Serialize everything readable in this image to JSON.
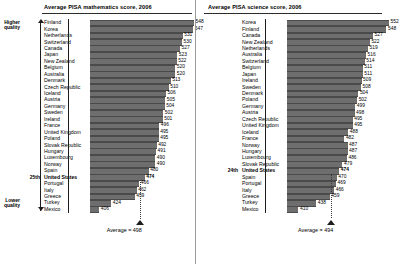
{
  "charts": [
    {
      "key": "math",
      "title": "Average PISA mathematics score, 2006",
      "higher_label_line1": "Higher",
      "higher_label_line2": "quality",
      "lower_label_line1": "Lower",
      "lower_label_line2": "quality",
      "us_rank": "25th",
      "average_label": "Average = 498",
      "average_value": 498,
      "bar_color": "#6e6e6e",
      "chart_data": {
        "type": "bar",
        "orientation": "horizontal",
        "title": "Average PISA mathematics score, 2006",
        "xlabel": "",
        "ylabel": "",
        "xlim": [
          400,
          560
        ],
        "grid": false,
        "legend": "none",
        "categories": [
          "Finland",
          "Korea",
          "Netherlands",
          "Switzerland",
          "Canada",
          "Japan",
          "New Zealand",
          "Belgium",
          "Australia",
          "Denmark",
          "Czech Republic",
          "Iceland",
          "Austria",
          "Germany",
          "Sweden",
          "Ireland",
          "France",
          "United Kingdom",
          "Poland",
          "Slovak Republic",
          "Hungary",
          "Luxembourg",
          "Norway",
          "Spain",
          "United States",
          "Portugal",
          "Italy",
          "Greece",
          "Turkey",
          "Mexico"
        ],
        "values": [
          548,
          547,
          531,
          530,
          527,
          523,
          522,
          520,
          520,
          513,
          510,
          506,
          505,
          504,
          502,
          501,
          496,
          495,
          495,
          492,
          491,
          490,
          490,
          480,
          474,
          466,
          462,
          459,
          424,
          406
        ],
        "highlight": "United States",
        "annotations": [
          "Average = 498"
        ]
      }
    },
    {
      "key": "science",
      "title": "Average PISA science score, 2006",
      "us_rank": "24th",
      "average_label": "Average = 494",
      "average_value": 494,
      "bar_color": "#6e6e6e",
      "chart_data": {
        "type": "bar",
        "orientation": "horizontal",
        "title": "Average PISA science score, 2006",
        "xlabel": "",
        "ylabel": "",
        "xlim": [
          400,
          560
        ],
        "grid": false,
        "legend": "none",
        "categories": [
          "Korea",
          "Finland",
          "Canada",
          "New Zealand",
          "Netherlands",
          "Australia",
          "Switzerland",
          "Belgium",
          "Japan",
          "Ireland",
          "Sweden",
          "Denmark",
          "Poland",
          "Germany",
          "Austria",
          "Czech Republic",
          "United Kingdom",
          "Iceland",
          "France",
          "Norway",
          "Hungary",
          "Luxembourg",
          "Slovak Republic",
          "United States",
          "Spain",
          "Portugal",
          "Italy",
          "Greece",
          "Turkey",
          "Mexico"
        ],
        "values": [
          552,
          548,
          527,
          522,
          519,
          516,
          514,
          511,
          511,
          509,
          508,
          504,
          502,
          499,
          498,
          495,
          495,
          488,
          482,
          487,
          487,
          486,
          479,
          474,
          470,
          469,
          466,
          459,
          438,
          410
        ],
        "highlight": "United States",
        "annotations": [
          "Average = 494"
        ]
      }
    }
  ]
}
